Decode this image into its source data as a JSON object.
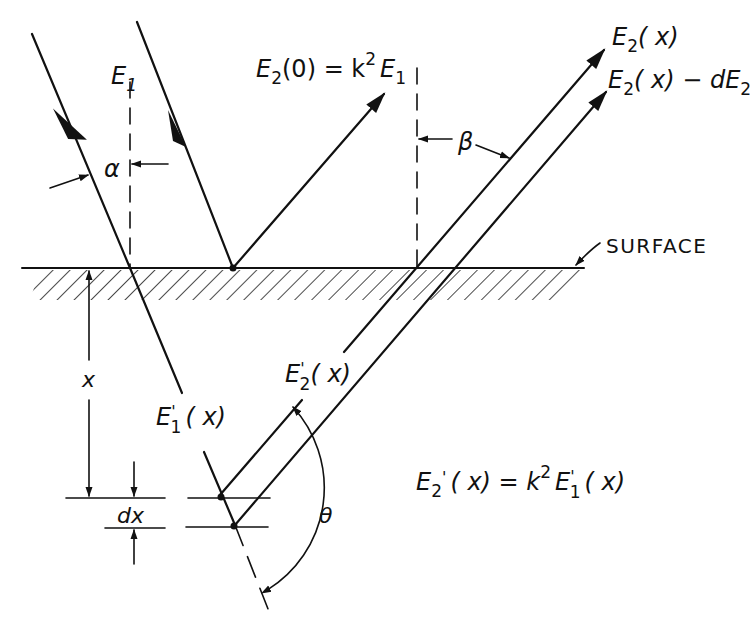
{
  "figure": {
    "type": "optics-reflection-depth-diagram",
    "labels": {
      "E1": "E",
      "E1_sub": "1",
      "alpha": "α",
      "beta": "β",
      "theta": "θ",
      "E2_0_main": "E",
      "E2_0_sub": "2",
      "E2_0_rest": "(0) = k",
      "E2_0_sup": "2",
      "E2_0_E": "E",
      "E2_0_E_sub": "1",
      "E2x_main": "E",
      "E2x_sub": "2",
      "E2x_rest": "( x)",
      "E2x_dE_main": "E",
      "E2x_dE_sub": "2",
      "E2x_dE_rest": "( x) − dE",
      "E2x_dE_sub2": "2",
      "surface": "SURFACE",
      "x": "x",
      "dx": "dx",
      "E1p_main": "E",
      "E1p_prime": "'",
      "E1p_sub": "1",
      "E1p_rest": "( x)",
      "E2p_main": "E",
      "E2p_prime": "'",
      "E2p_sub": "2",
      "E2p_rest": "( x)",
      "eq_lhs_main": "E",
      "eq_lhs_prime": "'",
      "eq_lhs_sub": "2",
      "eq_mid": "( x) = k",
      "eq_sup": "2",
      "eq_rhs_main": "E",
      "eq_rhs_prime": "'",
      "eq_rhs_sub": "1",
      "eq_rhs_rest": "( x)"
    },
    "colors": {
      "ink": "#111111",
      "background": "#ffffff"
    }
  }
}
